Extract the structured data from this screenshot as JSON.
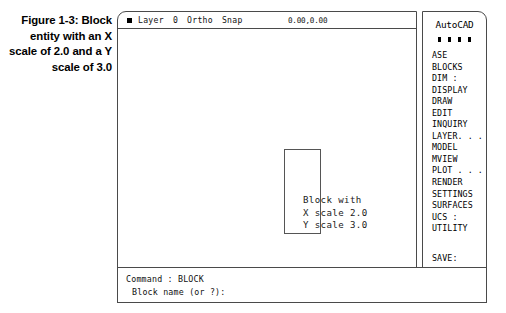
{
  "caption": {
    "text": "Figure 1-3: Block entity with an X scale of 2.0 and a Y scale of 3.0"
  },
  "statusbar": {
    "layer_label": "Layer",
    "layer_value": "0",
    "ortho": "Ortho",
    "snap": "Snap",
    "coordinates": "0.00,0.00",
    "mode_icon": "filled-square-icon"
  },
  "drawing": {
    "annotation_line1": "Block with",
    "annotation_line2": "X scale 2.0",
    "annotation_line3": "Y scale 3.0",
    "block_shape": "rectangle"
  },
  "side_menu": {
    "title": "AutoCAD",
    "separator": "* * * *",
    "items": [
      {
        "label": "ASE"
      },
      {
        "label": "BLOCKS"
      },
      {
        "label": "DIM :"
      },
      {
        "label": "DISPLAY"
      },
      {
        "label": "DRAW"
      },
      {
        "label": "EDIT"
      },
      {
        "label": "INQUIRY"
      },
      {
        "label": "LAYER. . ."
      },
      {
        "label": "MODEL"
      },
      {
        "label": "MVIEW"
      },
      {
        "label": "PLOT . . ."
      },
      {
        "label": "RENDER"
      },
      {
        "label": "SETTINGS"
      },
      {
        "label": "SURFACES"
      },
      {
        "label": "UCS :"
      },
      {
        "label": "UTILITY"
      }
    ],
    "save_item": "SAVE:"
  },
  "command_area": {
    "line1": "Command : BLOCK",
    "line2": "Block name (or ?):"
  },
  "colors": {
    "border": "#4a4a4a",
    "text": "#000000",
    "background": "#ffffff",
    "shape_stroke": "#555555"
  }
}
